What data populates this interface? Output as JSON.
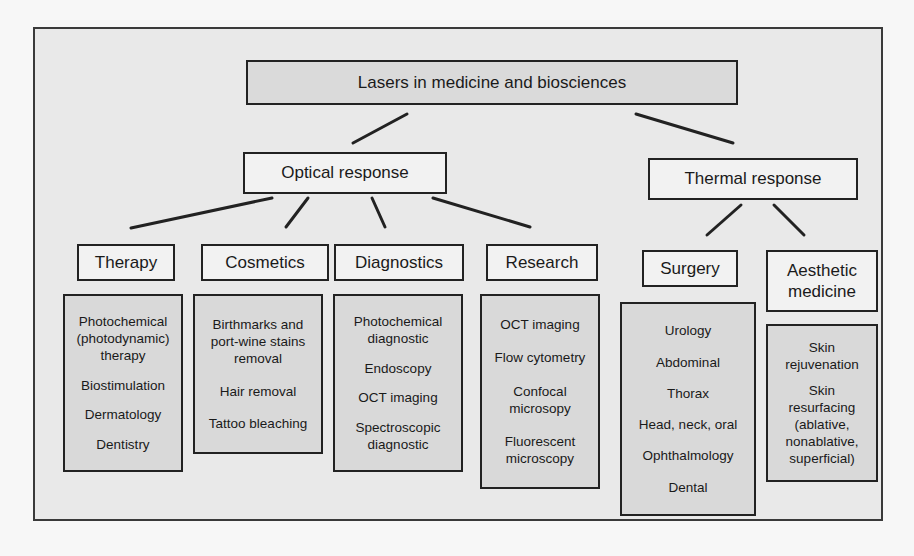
{
  "root": {
    "label": "Lasers in medicine and biosciences"
  },
  "branches": [
    {
      "label": "Optical response",
      "categories": [
        {
          "label": "Therapy",
          "items": [
            "Photochemical (photodynamic) therapy",
            "Biostimulation",
            "Dermatology",
            "Dentistry"
          ]
        },
        {
          "label": "Cosmetics",
          "items": [
            "Birthmarks and port-wine stains removal",
            "Hair removal",
            "Tattoo bleaching"
          ]
        },
        {
          "label": "Diagnostics",
          "items": [
            "Photochemical diagnostic",
            "Endoscopy",
            "OCT imaging",
            "Spectroscopic diagnostic"
          ]
        },
        {
          "label": "Research",
          "items": [
            "OCT imaging",
            "Flow cytometry",
            "Confocal microsopy",
            "Fluorescent microscopy"
          ]
        }
      ]
    },
    {
      "label": "Thermal response",
      "categories": [
        {
          "label": "Surgery",
          "items": [
            "Urology",
            "Abdominal",
            "Thorax",
            "Head, neck, oral",
            "Ophthalmology",
            "Dental"
          ]
        },
        {
          "label": "Aesthetic medicine",
          "items": [
            "Skin rejuvenation",
            "Skin resurfacing (ablative, nonablative, superficial)"
          ]
        }
      ]
    }
  ],
  "colors": {
    "frame_fill": "#e9e9e9",
    "detail_fill": "#d9d9d9",
    "border": "#222222"
  }
}
